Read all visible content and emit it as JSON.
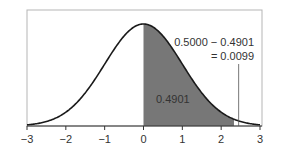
{
  "chart_data": {
    "type": "area",
    "title": "",
    "xlabel": "",
    "ylabel": "",
    "xlim": [
      -3,
      3
    ],
    "x_ticks": [
      -3,
      -2,
      -1,
      0,
      1,
      2,
      3
    ],
    "x_tick_labels": [
      "−3",
      "−2",
      "−1",
      "0",
      "1",
      "2",
      "3"
    ],
    "grid": false,
    "curve": "standard normal pdf",
    "shaded_region": {
      "from": 0,
      "to": 2.33,
      "area": 0.4901,
      "color": "#777777"
    },
    "annotations": [
      {
        "text": "0.4901",
        "location": "inside shaded region"
      },
      {
        "text": "0.5000 − 0.4901",
        "location": "upper right"
      },
      {
        "text": "= 0.0099",
        "location": "upper right, below"
      }
    ],
    "pointer_line_x": 2.45
  },
  "labels": {
    "shaded_area": "0.4901",
    "tail_line1": "0.5000 − 0.4901",
    "tail_line2": "= 0.0099",
    "ticks": [
      "−3",
      "−2",
      "−1",
      "0",
      "1",
      "2",
      "3"
    ]
  },
  "colors": {
    "shade": "#777777",
    "curve": "#1a1a1a",
    "frame": "#b5b5b5",
    "text": "#333333"
  }
}
